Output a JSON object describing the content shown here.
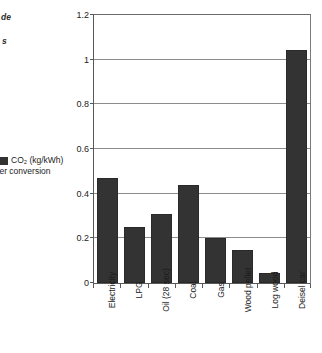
{
  "margin_notes": {
    "fragment_top": "de",
    "fragment_second": "s"
  },
  "legend": {
    "swatch_color": "#333333",
    "line1": "CO₂ (kg/kWh)",
    "line2": "after conversion"
  },
  "chart_data": {
    "type": "bar",
    "title": "",
    "xlabel": "",
    "ylabel": "",
    "ylim": [
      0,
      1.2
    ],
    "yticks": [
      "0",
      "0.2",
      "0.4",
      "0.6",
      "0.8",
      "1",
      "1.2"
    ],
    "ytick_values": [
      0,
      0.2,
      0.4,
      0.6,
      0.8,
      1,
      1.2
    ],
    "grid": "horizontal",
    "legend_position": "left-outside",
    "bar_color": "#333333",
    "series_name": "CO₂ (kg/kWh) after conversion",
    "categories": [
      "Electricity",
      "LPG",
      "Oil (28 sec)",
      "Coal",
      "Gas",
      "Wood pellet",
      "Log wood",
      "Deisel car"
    ],
    "values": [
      0.47,
      0.25,
      0.31,
      0.44,
      0.2,
      0.15,
      0.045,
      1.045
    ]
  }
}
